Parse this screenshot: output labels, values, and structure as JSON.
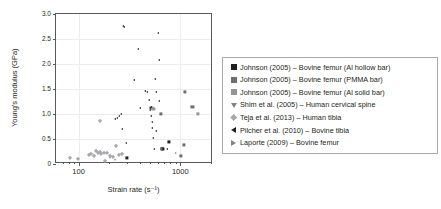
{
  "chart_data": {
    "type": "scatter",
    "title": "",
    "xlabel": "Strain rate (s⁻¹)",
    "ylabel": "Young's modulus (GPa)",
    "xscale": "log",
    "yscale": "linear",
    "xlim": [
      60,
      2100
    ],
    "ylim": [
      0,
      3.0
    ],
    "grid": true,
    "legend_position": "right",
    "y_ticks": [
      "0",
      "0.5",
      "1.0",
      "1.5",
      "2.0",
      "2.5",
      "3.0"
    ],
    "y_tick_values": [
      0,
      0.5,
      1.0,
      1.5,
      2.0,
      2.5,
      3.0
    ],
    "x_ticks": [
      "100",
      "1000"
    ],
    "x_tick_values": [
      100,
      1000
    ],
    "x_minor_ticks": [
      70,
      80,
      90,
      200,
      300,
      400,
      500,
      600,
      700,
      800,
      900,
      2000
    ],
    "series": [
      {
        "name": "Johnson (2005) – Bovine femur (Al hollow bar)",
        "marker": "square",
        "color": "#231f20",
        "points": [
          {
            "x": 300,
            "y": 0.12
          },
          {
            "x": 660,
            "y": 0.31
          },
          {
            "x": 680,
            "y": 0.31
          },
          {
            "x": 770,
            "y": 0.45
          }
        ]
      },
      {
        "name": "Johnson (2005) – Bovine femur (PMMA bar)",
        "marker": "square",
        "color": "#6d6e71",
        "points": [
          {
            "x": 640,
            "y": 1.01
          },
          {
            "x": 1010,
            "y": 0.16
          },
          {
            "x": 1080,
            "y": 0.39
          },
          {
            "x": 1120,
            "y": 1.44
          },
          {
            "x": 1320,
            "y": 1.15
          }
        ]
      },
      {
        "name": "Johnson (2005) – Bovine femur (Al solid bar)",
        "marker": "square",
        "color": "#939598",
        "points": [
          {
            "x": 1480,
            "y": 1.0
          },
          {
            "x": 520,
            "y": 1.12
          },
          {
            "x": 545,
            "y": 1.1
          }
        ]
      },
      {
        "name": "Shim et al. (2005) – Human cervical spine",
        "marker": "triangle-down",
        "color": "#808285",
        "points": [
          {
            "x": 205,
            "y": 0.13
          },
          {
            "x": 230,
            "y": 0.09
          },
          {
            "x": 250,
            "y": 0.19
          }
        ]
      },
      {
        "name": "Teja et al. (2013) – Human tibia",
        "marker": "diamond",
        "color": "#a7a9ac",
        "points": [
          {
            "x": 82,
            "y": 0.12
          },
          {
            "x": 99,
            "y": 0.1
          },
          {
            "x": 127,
            "y": 0.18
          },
          {
            "x": 133,
            "y": 0.21
          },
          {
            "x": 141,
            "y": 0.17
          },
          {
            "x": 150,
            "y": 0.26
          },
          {
            "x": 156,
            "y": 0.22
          },
          {
            "x": 163,
            "y": 0.24
          },
          {
            "x": 168,
            "y": 0.2
          },
          {
            "x": 176,
            "y": 0.23
          },
          {
            "x": 183,
            "y": 0.07
          },
          {
            "x": 192,
            "y": 0.22
          },
          {
            "x": 205,
            "y": 0.17
          },
          {
            "x": 219,
            "y": 0.14
          },
          {
            "x": 231,
            "y": 0.36
          },
          {
            "x": 252,
            "y": 0.18
          },
          {
            "x": 268,
            "y": 0.2
          },
          {
            "x": 162,
            "y": 0.87
          }
        ]
      },
      {
        "name": "Pilcher et al. (2010) – Bovine tibia",
        "marker": "triangle-left",
        "color": "#231f20",
        "points": [
          {
            "x": 228,
            "y": 0.9
          },
          {
            "x": 240,
            "y": 0.93
          },
          {
            "x": 252,
            "y": 0.96
          },
          {
            "x": 262,
            "y": 1.0
          },
          {
            "x": 268,
            "y": 0.71
          },
          {
            "x": 272,
            "y": 2.76
          },
          {
            "x": 278,
            "y": 2.74
          },
          {
            "x": 295,
            "y": 0.42
          },
          {
            "x": 352,
            "y": 1.69
          },
          {
            "x": 380,
            "y": 2.3
          },
          {
            "x": 400,
            "y": 1.12
          },
          {
            "x": 452,
            "y": 1.47
          },
          {
            "x": 470,
            "y": 1.44
          },
          {
            "x": 495,
            "y": 1.28
          },
          {
            "x": 500,
            "y": 1.12
          },
          {
            "x": 505,
            "y": 1.09
          },
          {
            "x": 512,
            "y": 1.14
          },
          {
            "x": 520,
            "y": 0.97
          },
          {
            "x": 528,
            "y": 0.85
          },
          {
            "x": 532,
            "y": 0.72
          },
          {
            "x": 540,
            "y": 0.53
          },
          {
            "x": 548,
            "y": 0.31
          },
          {
            "x": 560,
            "y": 1.7
          },
          {
            "x": 572,
            "y": 1.44
          },
          {
            "x": 580,
            "y": 0.66
          },
          {
            "x": 600,
            "y": 2.63
          },
          {
            "x": 612,
            "y": 2.08
          },
          {
            "x": 620,
            "y": 1.27
          },
          {
            "x": 735,
            "y": 0.3
          }
        ]
      },
      {
        "name": "Laporte (2009) – Bovine femur",
        "marker": "triangle-right",
        "color": "#808285",
        "points": [
          {
            "x": 660,
            "y": 0.3
          },
          {
            "x": 910,
            "y": 0.22
          }
        ]
      }
    ]
  },
  "axes": {
    "y_title": "Young's modulus (GPa)",
    "x_title": "Strain rate (s⁻¹)"
  },
  "legend": {
    "items": [
      {
        "label": "Johnson (2005) – Bovine femur (Al hollow bar)",
        "marker": "square",
        "color": "#231f20"
      },
      {
        "label": "Johnson (2005) – Bovine femur (PMMA bar)",
        "marker": "square",
        "color": "#6d6e71"
      },
      {
        "label": "Johnson (2005) – Bovine femur (Al solid bar)",
        "marker": "square",
        "color": "#939598"
      },
      {
        "label": "Shim et al. (2005) – Human cervical spine",
        "marker": "triangle-down",
        "color": "#808285"
      },
      {
        "label": "Teja et al. (2013) – Human tibia",
        "marker": "diamond",
        "color": "#a7a9ac"
      },
      {
        "label": "Pilcher et al. (2010) – Bovine tibia",
        "marker": "triangle-left",
        "color": "#231f20"
      },
      {
        "label": "Laporte (2009) – Bovine femur",
        "marker": "triangle-right",
        "color": "#808285"
      }
    ]
  }
}
